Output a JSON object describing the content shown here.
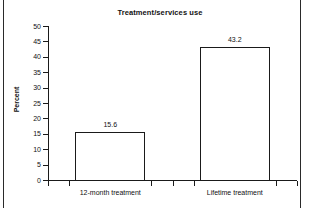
{
  "chart_data": {
    "type": "bar",
    "title": "Treatment/services use",
    "xlabel": "",
    "ylabel": "Percent",
    "categories": [
      "12-month treatment",
      "Lifetime treatment"
    ],
    "values": [
      15.6,
      43.2
    ],
    "value_labels": [
      "15.6",
      "43.2"
    ],
    "ylim": [
      0,
      50
    ],
    "ytick_step": 5,
    "yticks": [
      50,
      45,
      40,
      35,
      30,
      25,
      20,
      15,
      10,
      5,
      0
    ],
    "ytick_labels": [
      "50",
      "45",
      "40",
      "35",
      "30",
      "25",
      "20",
      "15",
      "10",
      "5",
      "0"
    ],
    "grid": false,
    "legend": null,
    "bar_fill_color": "#ffffff",
    "bar_edge_color": "#1a1a1a",
    "axis_color": "#1a1a1a",
    "text_color": "#111111"
  },
  "page": {
    "background_color": "#ffffff",
    "rule_color": "#2a2a2a"
  }
}
